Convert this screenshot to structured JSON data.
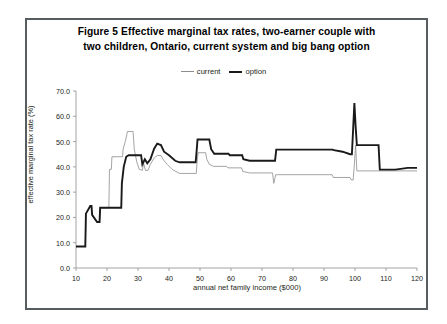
{
  "figure": {
    "title_line_1": "Figure 5  Effective marginal tax rates, two-earner couple with",
    "title_line_2": "two children,  Ontario, current system and big bang option"
  },
  "legend": {
    "position": "top-center",
    "entries": [
      {
        "label": "current",
        "color": "#8d8d8d",
        "icon": "line-swatch-icon"
      },
      {
        "label": "option",
        "color": "#1a1a1a",
        "icon": "line-swatch-icon"
      }
    ]
  },
  "chart_data": {
    "type": "line",
    "title": "Figure 5  Effective marginal tax rates, two-earner couple with two children,  Ontario, current system and big bang option",
    "xlabel": "annual net family income ($000)",
    "ylabel": "effective marginal tax rate (%)",
    "xlim": [
      10,
      120
    ],
    "ylim": [
      0,
      70
    ],
    "xticks": [
      10,
      20,
      30,
      40,
      50,
      60,
      70,
      80,
      90,
      100,
      110,
      120
    ],
    "yticks": [
      0.0,
      10.0,
      20.0,
      30.0,
      40.0,
      50.0,
      60.0,
      70.0
    ],
    "ytick_labels": [
      "0.0",
      "10.0",
      "20.0",
      "30.0",
      "40.0",
      "50.0",
      "60.0",
      "70.0"
    ],
    "xtick_labels": [
      "10",
      "20",
      "30",
      "40",
      "50",
      "60",
      "70",
      "80",
      "90",
      "100",
      "110",
      "120"
    ],
    "grid": false,
    "legend_position": "top-center",
    "series": [
      {
        "name": "current",
        "color": "#8d8d8d",
        "width": 0.8,
        "points": [
          [
            10.0,
            8.5
          ],
          [
            13.0,
            8.5
          ],
          [
            13.2,
            21.5
          ],
          [
            14.6,
            24.5
          ],
          [
            15.0,
            24.5
          ],
          [
            15.2,
            21.0
          ],
          [
            16.8,
            18.2
          ],
          [
            17.6,
            18.2
          ],
          [
            17.8,
            23.8
          ],
          [
            20.6,
            23.8
          ],
          [
            20.8,
            39.0
          ],
          [
            21.4,
            39.0
          ],
          [
            21.6,
            44.0
          ],
          [
            25.0,
            44.0
          ],
          [
            25.2,
            47.0
          ],
          [
            26.0,
            50.5
          ],
          [
            26.6,
            54.0
          ],
          [
            28.4,
            54.0
          ],
          [
            28.8,
            47.0
          ],
          [
            29.6,
            42.0
          ],
          [
            30.4,
            39.0
          ],
          [
            31.4,
            38.6
          ],
          [
            31.8,
            41.5
          ],
          [
            32.4,
            38.6
          ],
          [
            33.2,
            38.6
          ],
          [
            34.0,
            41.0
          ],
          [
            35.2,
            43.5
          ],
          [
            36.2,
            44.5
          ],
          [
            37.4,
            44.5
          ],
          [
            38.2,
            42.8
          ],
          [
            39.4,
            41.0
          ],
          [
            41.0,
            39.0
          ],
          [
            43.4,
            37.4
          ],
          [
            48.8,
            37.4
          ],
          [
            49.0,
            41.0
          ],
          [
            49.4,
            45.6
          ],
          [
            51.8,
            45.6
          ],
          [
            52.2,
            43.0
          ],
          [
            53.0,
            41.0
          ],
          [
            54.4,
            40.2
          ],
          [
            58.6,
            40.2
          ],
          [
            59.0,
            39.6
          ],
          [
            63.4,
            39.6
          ],
          [
            63.8,
            38.2
          ],
          [
            66.0,
            37.6
          ],
          [
            73.4,
            37.6
          ],
          [
            73.8,
            33.5
          ],
          [
            74.4,
            36.9
          ],
          [
            75.0,
            36.9
          ],
          [
            92.6,
            36.9
          ],
          [
            93.0,
            35.8
          ],
          [
            98.4,
            35.8
          ],
          [
            98.8,
            34.8
          ],
          [
            99.4,
            34.8
          ],
          [
            99.8,
            41.0
          ],
          [
            100.2,
            48.6
          ],
          [
            100.6,
            38.4
          ],
          [
            107.6,
            38.4
          ],
          [
            108.0,
            38.4
          ],
          [
            112.0,
            38.4
          ],
          [
            120.0,
            38.4
          ]
        ]
      },
      {
        "name": "option",
        "color": "#1a1a1a",
        "width": 1.9,
        "points": [
          [
            10.0,
            8.5
          ],
          [
            13.0,
            8.5
          ],
          [
            13.2,
            21.5
          ],
          [
            14.6,
            24.5
          ],
          [
            15.0,
            24.5
          ],
          [
            15.2,
            21.0
          ],
          [
            16.8,
            18.2
          ],
          [
            17.6,
            18.2
          ],
          [
            17.8,
            23.8
          ],
          [
            24.6,
            23.8
          ],
          [
            24.8,
            33.5
          ],
          [
            25.4,
            40.0
          ],
          [
            26.2,
            44.0
          ],
          [
            27.0,
            44.6
          ],
          [
            31.0,
            44.6
          ],
          [
            31.4,
            41.0
          ],
          [
            32.2,
            43.0
          ],
          [
            33.0,
            41.4
          ],
          [
            34.0,
            43.0
          ],
          [
            35.2,
            47.2
          ],
          [
            36.2,
            49.2
          ],
          [
            37.4,
            48.6
          ],
          [
            38.4,
            46.0
          ],
          [
            40.0,
            44.6
          ],
          [
            42.0,
            42.4
          ],
          [
            43.4,
            41.8
          ],
          [
            48.6,
            41.8
          ],
          [
            48.9,
            46.0
          ],
          [
            49.2,
            50.8
          ],
          [
            53.0,
            50.8
          ],
          [
            53.6,
            47.0
          ],
          [
            54.6,
            45.2
          ],
          [
            59.2,
            45.2
          ],
          [
            59.6,
            44.6
          ],
          [
            63.6,
            44.6
          ],
          [
            64.0,
            43.0
          ],
          [
            66.0,
            42.4
          ],
          [
            74.2,
            42.4
          ],
          [
            74.6,
            46.8
          ],
          [
            92.8,
            46.8
          ],
          [
            93.2,
            46.6
          ],
          [
            96.0,
            46.0
          ],
          [
            98.4,
            45.0
          ],
          [
            99.0,
            45.0
          ],
          [
            99.4,
            55.0
          ],
          [
            99.8,
            65.2
          ],
          [
            100.2,
            56.0
          ],
          [
            100.6,
            48.6
          ],
          [
            101.4,
            48.6
          ],
          [
            107.6,
            48.6
          ],
          [
            108.0,
            38.9
          ],
          [
            113.0,
            38.9
          ],
          [
            117.0,
            39.6
          ],
          [
            120.0,
            39.6
          ]
        ]
      }
    ]
  }
}
